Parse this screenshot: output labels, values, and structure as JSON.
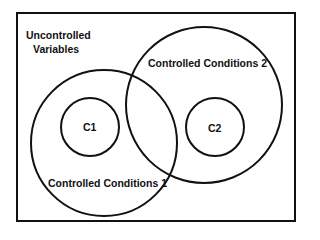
{
  "diagram": {
    "outer_label_line1": "Uncontrolled",
    "outer_label_line2": "Variables",
    "circles": [
      {
        "label": "Controlled Conditions 1"
      },
      {
        "label": "Controlled Conditions 2"
      },
      {
        "label": "C1"
      },
      {
        "label": "C2"
      }
    ],
    "stroke_color": "#111111",
    "background": "#ffffff"
  }
}
